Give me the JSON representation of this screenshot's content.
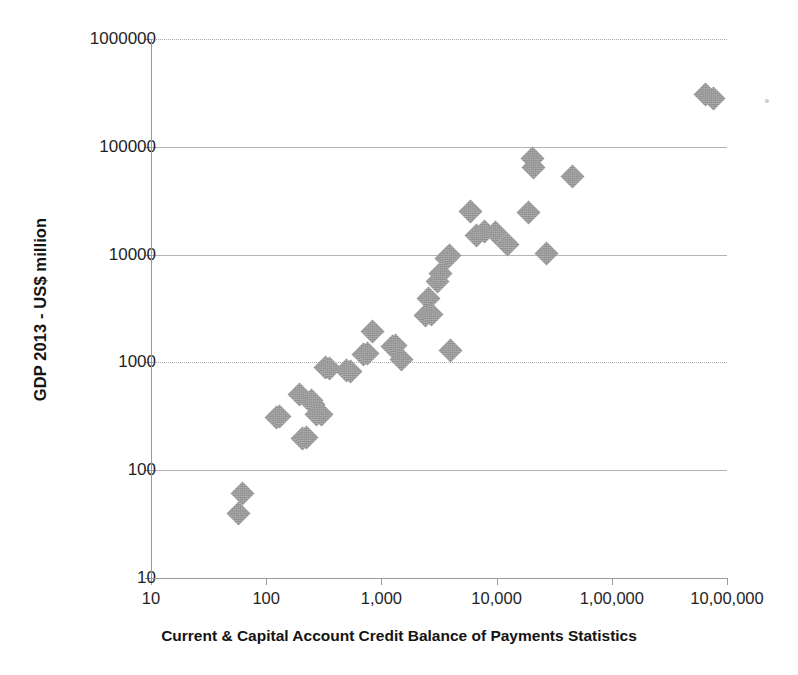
{
  "chart_data": {
    "type": "scatter",
    "title": "",
    "xlabel": "Current & Capital Account Credit Balance of Payments Statistics",
    "ylabel": "GDP 2013 - US$ million",
    "xscale": "log",
    "yscale": "log",
    "xlim": [
      10,
      1000000
    ],
    "ylim": [
      10,
      1000000
    ],
    "grid": true,
    "legend": "none",
    "marker": "diamond",
    "marker_color": "#8f8f8f",
    "xticks": [
      "10",
      "100",
      "1,000",
      "10,000",
      "1,00,000",
      "10,00,000"
    ],
    "xtick_values": [
      10,
      100,
      1000,
      10000,
      100000,
      1000000
    ],
    "yticks": [
      "10",
      "100",
      "1000",
      "10000",
      "100000",
      "1000000"
    ],
    "ytick_values": [
      10,
      100,
      1000,
      10000,
      100000,
      1000000
    ],
    "points": [
      {
        "x": 58,
        "y": 40
      },
      {
        "x": 62,
        "y": 61
      },
      {
        "x": 122,
        "y": 310
      },
      {
        "x": 131,
        "y": 315
      },
      {
        "x": 196,
        "y": 500
      },
      {
        "x": 206,
        "y": 195
      },
      {
        "x": 224,
        "y": 200
      },
      {
        "x": 245,
        "y": 445
      },
      {
        "x": 258,
        "y": 410
      },
      {
        "x": 272,
        "y": 330
      },
      {
        "x": 300,
        "y": 330
      },
      {
        "x": 330,
        "y": 900
      },
      {
        "x": 355,
        "y": 880
      },
      {
        "x": 500,
        "y": 840
      },
      {
        "x": 540,
        "y": 830
      },
      {
        "x": 700,
        "y": 1180
      },
      {
        "x": 760,
        "y": 1200
      },
      {
        "x": 830,
        "y": 1950
      },
      {
        "x": 1250,
        "y": 1400
      },
      {
        "x": 1320,
        "y": 1440
      },
      {
        "x": 1500,
        "y": 1060
      },
      {
        "x": 2400,
        "y": 2700
      },
      {
        "x": 2550,
        "y": 3900
      },
      {
        "x": 2700,
        "y": 2800
      },
      {
        "x": 3050,
        "y": 5600
      },
      {
        "x": 3250,
        "y": 6700
      },
      {
        "x": 3700,
        "y": 9200
      },
      {
        "x": 3900,
        "y": 9800
      },
      {
        "x": 3950,
        "y": 1300
      },
      {
        "x": 5900,
        "y": 25000
      },
      {
        "x": 6700,
        "y": 15000
      },
      {
        "x": 7900,
        "y": 16500
      },
      {
        "x": 9800,
        "y": 16000
      },
      {
        "x": 12500,
        "y": 12500
      },
      {
        "x": 19000,
        "y": 24500
      },
      {
        "x": 20500,
        "y": 78000
      },
      {
        "x": 21000,
        "y": 64000
      },
      {
        "x": 27000,
        "y": 10300
      },
      {
        "x": 46000,
        "y": 53000
      },
      {
        "x": 650000,
        "y": 305000
      },
      {
        "x": 760000,
        "y": 280000
      }
    ]
  },
  "axes": {
    "y_title": "GDP 2013 - US$ million",
    "x_title": "Current & Capital Account Credit Balance of Payments Statistics"
  }
}
